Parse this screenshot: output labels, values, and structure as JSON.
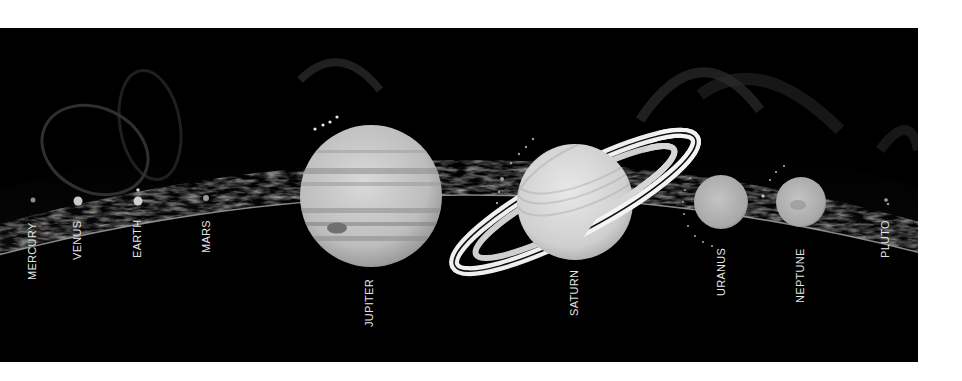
{
  "diagram": {
    "title": "",
    "background_color": "#000000",
    "sun_limb_color": "#9a9a9a",
    "planets": [
      {
        "id": "mercury",
        "label": "MERCURY",
        "cx": 33,
        "cy": 200,
        "r": 2.5
      },
      {
        "id": "venus",
        "label": "VENUS",
        "cx": 78,
        "cy": 201,
        "r": 4.5
      },
      {
        "id": "earth",
        "label": "EARTH",
        "cx": 138,
        "cy": 201,
        "r": 4.5
      },
      {
        "id": "mars",
        "label": "MARS",
        "cx": 206,
        "cy": 198,
        "r": 3
      },
      {
        "id": "jupiter",
        "label": "JUPITER",
        "cx": 371,
        "cy": 196,
        "r": 71
      },
      {
        "id": "saturn",
        "label": "SATURN",
        "cx": 575,
        "cy": 202,
        "r": 58
      },
      {
        "id": "uranus",
        "label": "URANUS",
        "cx": 721,
        "cy": 202,
        "r": 27
      },
      {
        "id": "neptune",
        "label": "NEPTUNE",
        "cx": 801,
        "cy": 202,
        "r": 25
      },
      {
        "id": "pluto",
        "label": "PLUTO",
        "cx": 886,
        "cy": 201,
        "r": 1.8
      }
    ],
    "labels": {
      "mercury": "MERCURY",
      "venus": "VENUS",
      "earth": "EARTH",
      "mars": "MARS",
      "jupiter": "JUPITER",
      "saturn": "SATURN",
      "uranus": "URANUS",
      "neptune": "NEPTUNE",
      "pluto": "PLUTO"
    }
  }
}
